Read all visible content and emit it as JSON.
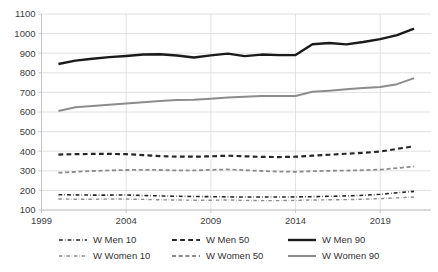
{
  "chart_data": {
    "type": "line",
    "title": "",
    "subtitle": "",
    "xlabel": "",
    "ylabel": "",
    "grid": true,
    "legend_position": "bottom",
    "xlim": [
      1999,
      2022
    ],
    "ylim": [
      100,
      1100
    ],
    "y_ticks": [
      100,
      200,
      300,
      400,
      500,
      600,
      700,
      800,
      900,
      1000,
      1100
    ],
    "x_ticks": [
      1999,
      2004,
      2009,
      2014,
      2019
    ],
    "x_tick_labels": [
      "1999",
      "2004",
      "2009",
      "2014",
      "2019"
    ],
    "y_tick_labels": [
      "100",
      "200",
      "300",
      "400",
      "500",
      "600",
      "700",
      "800",
      "900",
      "1000",
      "1100"
    ],
    "x": [
      2000,
      2001,
      2002,
      2003,
      2004,
      2005,
      2006,
      2007,
      2008,
      2009,
      2010,
      2011,
      2012,
      2013,
      2014,
      2015,
      2016,
      2017,
      2018,
      2019,
      2020,
      2021
    ],
    "series": [
      {
        "name": "W Men 10",
        "color": "#262626",
        "dash": "dashdot",
        "width": 1.6,
        "values": [
          178,
          177,
          176,
          176,
          177,
          174,
          172,
          170,
          169,
          168,
          167,
          166,
          166,
          166,
          167,
          168,
          170,
          172,
          175,
          180,
          188,
          195
        ]
      },
      {
        "name": "W Men 50",
        "color": "#262626",
        "dash": "dashed",
        "width": 2.2,
        "values": [
          383,
          385,
          386,
          386,
          385,
          380,
          375,
          372,
          372,
          374,
          377,
          374,
          371,
          370,
          372,
          377,
          382,
          387,
          392,
          398,
          412,
          425
        ]
      },
      {
        "name": "W Men 90",
        "color": "#1a1a1a",
        "dash": "solid",
        "width": 2.4,
        "values": [
          845,
          862,
          872,
          880,
          886,
          893,
          895,
          888,
          878,
          889,
          898,
          885,
          893,
          890,
          891,
          946,
          952,
          945,
          957,
          972,
          992,
          1025
        ]
      },
      {
        "name": "W Women 10",
        "color": "#8c8c8c",
        "dash": "dashdot",
        "width": 1.4,
        "values": [
          156,
          155,
          155,
          156,
          156,
          154,
          152,
          151,
          150,
          150,
          151,
          149,
          148,
          148,
          149,
          151,
          152,
          153,
          155,
          158,
          162,
          166
        ]
      },
      {
        "name": "W Women 50",
        "color": "#8c8c8c",
        "dash": "dashed",
        "width": 1.8,
        "values": [
          290,
          295,
          299,
          302,
          304,
          305,
          304,
          302,
          302,
          305,
          307,
          303,
          299,
          296,
          295,
          298,
          300,
          301,
          303,
          306,
          314,
          322
        ]
      },
      {
        "name": "W Women 90",
        "color": "#8c8c8c",
        "dash": "solid",
        "width": 2.0,
        "values": [
          605,
          624,
          631,
          637,
          643,
          650,
          656,
          661,
          663,
          668,
          674,
          678,
          681,
          681,
          682,
          703,
          709,
          716,
          722,
          727,
          742,
          773
        ]
      }
    ]
  },
  "legend": {
    "entries": [
      {
        "label": "W Men 10"
      },
      {
        "label": "W Men 50"
      },
      {
        "label": "W Men 90"
      },
      {
        "label": "W Women 10"
      },
      {
        "label": "W Women 50"
      },
      {
        "label": "W Women 90"
      }
    ]
  }
}
